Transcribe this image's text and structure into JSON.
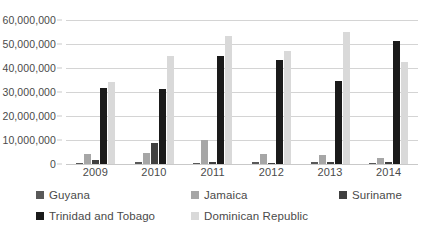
{
  "chart_data": {
    "type": "bar",
    "title": "",
    "subtitle": "",
    "xlabel": "",
    "ylabel": "",
    "categories": [
      "2009",
      "2010",
      "2011",
      "2012",
      "2013",
      "2014"
    ],
    "ylim": [
      0,
      60000000
    ],
    "yticks": [
      0,
      10000000,
      20000000,
      30000000,
      40000000,
      50000000,
      60000000
    ],
    "ytick_labels": [
      "0",
      "10,000,000",
      "20,000,000",
      "30,000,000",
      "40,000,000",
      "50,000,000",
      "60,000,000"
    ],
    "grid": true,
    "legend_position": "bottom",
    "series": [
      {
        "name": "Guyana",
        "color": "#595959",
        "values": [
          600000,
          700000,
          600000,
          700000,
          700000,
          600000
        ]
      },
      {
        "name": "Jamaica",
        "color": "#a6a6a6",
        "values": [
          4000000,
          4500000,
          10000000,
          4000000,
          3700000,
          2400000
        ]
      },
      {
        "name": "Suriname",
        "color": "#404040",
        "values": [
          1500000,
          8800000,
          700000,
          600000,
          900000,
          800000
        ]
      },
      {
        "name": "Trinidad and Tobago",
        "color": "#1a1a1a",
        "values": [
          31500000,
          31300000,
          45000000,
          43200000,
          34600000,
          51200000
        ]
      },
      {
        "name": "Dominican Republic",
        "color": "#d9d9d9",
        "values": [
          34000000,
          45200000,
          53500000,
          47000000,
          54800000,
          42500000
        ]
      }
    ]
  }
}
